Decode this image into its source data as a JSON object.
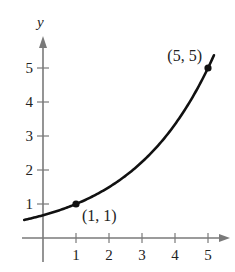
{
  "chart_data": {
    "type": "line",
    "title": "",
    "xlabel": "",
    "ylabel": "y",
    "xlim": [
      -0.6,
      5.6
    ],
    "ylim": [
      -0.7,
      5.8
    ],
    "grid": false,
    "x_ticks": [
      1,
      2,
      3,
      4,
      5
    ],
    "y_ticks": [
      1,
      2,
      3,
      4,
      5
    ],
    "x_tick_labels": [
      "1",
      "2",
      "3",
      "4",
      "5"
    ],
    "y_tick_labels": [
      "1",
      "2",
      "3",
      "4",
      "5"
    ],
    "series": [
      {
        "name": "y = a·b^x (exponential through (1,1) and (5,5))",
        "function": "y = 5^(-1/4) * (5^(1/4))^x",
        "x": [
          -0.55,
          0,
          1,
          2,
          3,
          4,
          5,
          5.2
        ],
        "y": [
          0.55,
          0.67,
          1.0,
          1.5,
          2.24,
          3.34,
          5.0,
          5.41
        ]
      }
    ],
    "points": [
      {
        "x": 1,
        "y": 1,
        "label": "(1, 1)"
      },
      {
        "x": 5,
        "y": 5,
        "label": "(5, 5)"
      }
    ],
    "legend": null
  },
  "layout": {
    "origin_px": [
      43,
      238
    ],
    "x_unit_px": 33,
    "y_unit_px": 34,
    "curve_color": "#111111",
    "axis_color": "#7a7a7a"
  }
}
